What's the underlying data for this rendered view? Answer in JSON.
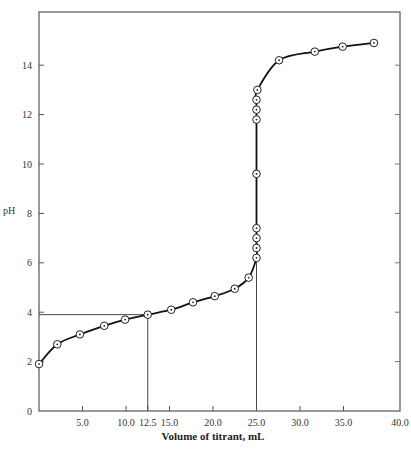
{
  "chart_data": {
    "type": "line",
    "title": "",
    "xlabel": "Volume of titrant, mL",
    "ylabel": "pH",
    "xlim": [
      0,
      40
    ],
    "ylim": [
      0,
      15
    ],
    "grid": false,
    "x_ticks": [
      5.0,
      10.0,
      12.5,
      15.0,
      20.0,
      25.0,
      30.0,
      35.0,
      40.0
    ],
    "x_tick_labels": [
      "5.0",
      "10.0",
      "12.5",
      "15.0",
      "20.0",
      "25.0",
      "30.0",
      "35.0",
      "40.0"
    ],
    "y_ticks": [
      0,
      2,
      4,
      6,
      8,
      10,
      12,
      14
    ],
    "y_tick_labels": [
      "0",
      "2",
      "4",
      "6",
      "8",
      "10",
      "12",
      "14"
    ],
    "series": [
      {
        "name": "Titration curve",
        "marker": "circle-dot",
        "x": [
          0.0,
          2.1,
          4.7,
          7.5,
          9.9,
          12.5,
          15.2,
          17.7,
          20.2,
          22.5,
          24.1,
          25.0,
          25.0,
          25.0,
          25.0,
          25.0,
          25.0,
          25.0,
          25.0,
          25.1,
          27.6,
          31.7,
          34.9,
          38.5
        ],
        "y": [
          1.9,
          2.7,
          3.1,
          3.45,
          3.7,
          3.9,
          4.1,
          4.4,
          4.65,
          4.95,
          5.4,
          6.2,
          6.6,
          7.0,
          7.4,
          9.6,
          11.8,
          12.2,
          12.6,
          13.0,
          14.2,
          14.55,
          14.75,
          14.9
        ]
      }
    ],
    "annotations": [
      {
        "type": "guide",
        "description": "half-equivalence point",
        "x": 12.5,
        "y": 3.9
      },
      {
        "type": "guide",
        "description": "equivalence point",
        "x": 25.0
      }
    ]
  }
}
